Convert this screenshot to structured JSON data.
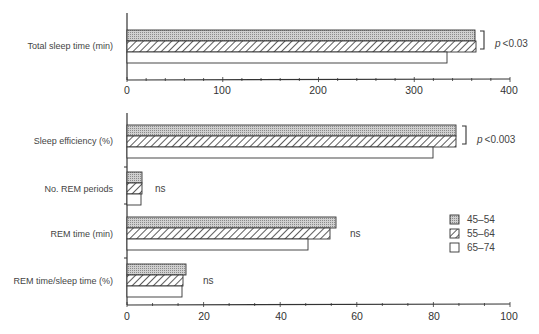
{
  "chart_data": [
    {
      "type": "bar",
      "orientation": "horizontal",
      "categories": [
        "Total sleep time (min)"
      ],
      "series": [
        {
          "name": "45–54",
          "values": [
            364
          ]
        },
        {
          "name": "55–64",
          "values": [
            365
          ]
        },
        {
          "name": "65–74",
          "values": [
            334
          ]
        }
      ],
      "xlim": [
        0,
        400
      ],
      "xticks": [
        "0",
        "100",
        "200",
        "300",
        "400"
      ],
      "annotations": [
        {
          "category": "Total sleep time (min)",
          "text": "p < 0.03",
          "bracket": [
            "45–54",
            "55–64"
          ]
        }
      ]
    },
    {
      "type": "bar",
      "orientation": "horizontal",
      "categories": [
        "Sleep efficiency (%)",
        "No. REM periods",
        "REM time (min)",
        "REM time/sleep time (%)"
      ],
      "series": [
        {
          "name": "45–54",
          "values": [
            86,
            4,
            54.5,
            15.4
          ]
        },
        {
          "name": "55–64",
          "values": [
            86,
            4,
            53,
            14.7
          ]
        },
        {
          "name": "65–74",
          "values": [
            80,
            3.7,
            47,
            14.4
          ]
        }
      ],
      "xlim": [
        0,
        100
      ],
      "xticks": [
        "0",
        "20",
        "40",
        "60",
        "80",
        "100"
      ],
      "annotations": [
        {
          "category": "Sleep efficiency (%)",
          "text": "p < 0.003",
          "bracket": [
            "45–54",
            "55–64"
          ]
        },
        {
          "category": "No. REM periods",
          "text": "ns"
        },
        {
          "category": "REM time (min)",
          "text": "ns"
        },
        {
          "category": "REM time/sleep time (%)",
          "text": "ns"
        }
      ],
      "legend": {
        "position": "right",
        "entries": [
          "45–54",
          "55–64",
          "65–74"
        ]
      }
    }
  ],
  "labels": {
    "top_cat": "Total sleep time (min)",
    "cat0": "Sleep efficiency (%)",
    "cat1": "No. REM periods",
    "cat2": "REM time (min)",
    "cat3": "REM time/sleep time (%)",
    "p_top": "<0.03",
    "p_eff": "<0.003",
    "p_letter": "p",
    "ns": "ns",
    "legend0": "45–54",
    "legend1": "55–64",
    "legend2": "65–74",
    "top_ticks": [
      "0",
      "100",
      "200",
      "300",
      "400"
    ],
    "bottom_ticks": [
      "0",
      "20",
      "40",
      "60",
      "80",
      "100"
    ]
  }
}
